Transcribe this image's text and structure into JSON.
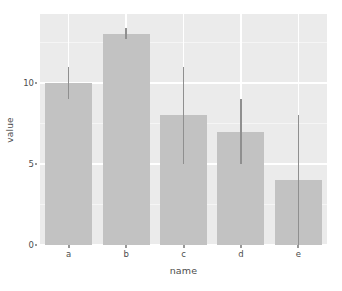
{
  "chart_data": {
    "type": "bar",
    "title": "",
    "subtitle": "",
    "xlabel": "name",
    "ylabel": "value",
    "categories": [
      "a",
      "b",
      "c",
      "d",
      "e"
    ],
    "values": [
      10,
      13,
      8,
      7,
      4
    ],
    "error_low": [
      9,
      12.7,
      5,
      5,
      0
    ],
    "error_high": [
      11,
      13.4,
      11,
      9,
      8
    ],
    "ylim": [
      0,
      14.25
    ],
    "xtick_labels": [
      "a",
      "b",
      "c",
      "d",
      "e"
    ],
    "ytick_labels": [
      "0",
      "5",
      "10"
    ],
    "ytick_values": [
      0,
      5,
      10
    ],
    "yminor_values": [
      2.5,
      7.5,
      12.5
    ],
    "grid": true,
    "legend": "none",
    "series": [
      {
        "name": "value",
        "values": [
          10,
          13,
          8,
          7,
          4
        ]
      }
    ],
    "colors": {
      "bar_fill": "#c2c2c2",
      "errorbar": "#8f8f8f",
      "panel_background": "#ebebeb",
      "grid_major": "#ffffff",
      "grid_minor": "#f5f5f5",
      "text": "#4d4d4d",
      "page_background": "#ffffff"
    }
  }
}
